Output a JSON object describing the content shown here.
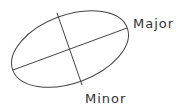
{
  "diagram": {
    "type": "ellipse-axes",
    "labels": {
      "major": "Major",
      "minor": "Minor"
    },
    "colors": {
      "stroke": "#444444",
      "text": "#333333",
      "background": "#ffffff"
    }
  }
}
